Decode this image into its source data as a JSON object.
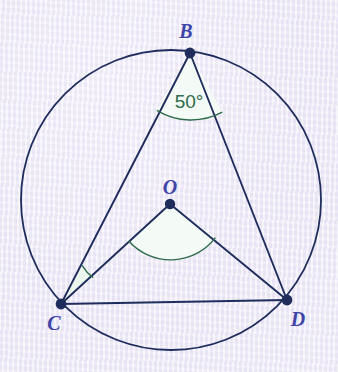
{
  "figure": {
    "background_color": "#ece8f6",
    "stroke_color": "#1e2d5c",
    "point_color": "#1e2d5c",
    "label_color": "#3f45a8",
    "angle_color": "#2e6b4a",
    "angle_fill": "#f2faf4"
  },
  "circle": {
    "name": "circumscribed-circle",
    "cx": 171,
    "cy": 200,
    "r": 150,
    "stroke_width": 1.8
  },
  "points": [
    {
      "id": "B",
      "label": "B",
      "x": 190,
      "y": 53,
      "label_x": 186,
      "label_y": 38
    },
    {
      "id": "O",
      "label": "O",
      "x": 170,
      "y": 204,
      "label_x": 170,
      "label_y": 194
    },
    {
      "id": "C",
      "label": "C",
      "x": 61,
      "y": 304,
      "label_x": 54,
      "label_y": 330
    },
    {
      "id": "D",
      "label": "D",
      "x": 287,
      "y": 300,
      "label_x": 298,
      "label_y": 326
    }
  ],
  "segments": [
    {
      "name": "segment-BC",
      "from": "B",
      "to": "C",
      "x1": 190,
      "y1": 53,
      "x2": 61,
      "y2": 304
    },
    {
      "name": "segment-BD",
      "from": "B",
      "to": "D",
      "x1": 190,
      "y1": 53,
      "x2": 287,
      "y2": 300
    },
    {
      "name": "segment-OC",
      "from": "O",
      "to": "C",
      "x1": 170,
      "y1": 204,
      "x2": 61,
      "y2": 304
    },
    {
      "name": "segment-OD",
      "from": "O",
      "to": "D",
      "x1": 170,
      "y1": 204,
      "x2": 287,
      "y2": 300
    },
    {
      "name": "segment-CD",
      "from": "C",
      "to": "D",
      "x1": 61,
      "y1": 304,
      "x2": 287,
      "y2": 300
    }
  ],
  "angles": [
    {
      "name": "angle-at-B",
      "vertex": "B",
      "label": "50°",
      "value": 50,
      "unit": "degrees",
      "labeled": true,
      "label_x": 189,
      "label_y": 108,
      "arc_radius": 66,
      "fill": "#f4fbf6",
      "stroke": "#2e6b4a",
      "arc_path": "M 156.8 110.3 A 66 66 0 0 0 222.3 112.2 L 190 53 Z"
    },
    {
      "name": "angle-at-O",
      "vertex": "O",
      "label": "",
      "labeled": false,
      "arc_radius": 56,
      "fill": "#f4fbf6",
      "stroke": "#2e6b4a",
      "arc_path": "M 128.8 241.0 A 56 56 0 0 0 215.4 237.7 L 170 204 Z"
    },
    {
      "name": "angle-at-C",
      "vertex": "C",
      "label": "",
      "labeled": false,
      "arc_radius": 44,
      "fill": "#f2faf4",
      "stroke": "#2e6b4a",
      "arc_path": "M 82.0 265.3 A 44 44 0 0 0 93.1 277.6 L 61 304 Z"
    }
  ]
}
